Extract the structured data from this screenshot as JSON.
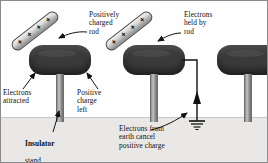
{
  "figure": {
    "background_color": "#fefefe",
    "floor_color": "#e9e8e6",
    "dome_color": "#3a3a3a",
    "rod_color": "#d6d6d6",
    "ink_color": "#0d0d0d"
  },
  "labels": {
    "positively_charged_rod": "Positively\ncharged\nrod",
    "electrons_held_by_rod": "Electrons\nheld by\nrod",
    "electrons_attracted": "Electrons\nattracted",
    "positive_charge_left": "Positive\ncharge\nleft",
    "insulator_bold": "Insulator",
    "insulator_rest": "stand",
    "electrons_from_earth": "Electrons from\nearth cancel\npositive charge"
  },
  "rods": [
    {
      "id": "rod-1",
      "charge_symbol": "+",
      "charge_count": 4,
      "angle_deg": -38
    },
    {
      "id": "rod-2",
      "charge_symbol": "+",
      "charge_count": 4,
      "angle_deg": -38
    }
  ],
  "panels": [
    {
      "id": "panel-1",
      "stage": 1,
      "has_rod": true,
      "has_earth_wire": false,
      "dome_charge": "positive-left-negative-right"
    },
    {
      "id": "panel-2",
      "stage": 2,
      "has_rod": true,
      "has_earth_wire": true,
      "dome_charge": "negative-induced"
    },
    {
      "id": "panel-3",
      "stage": 3,
      "has_rod": false,
      "has_earth_wire": false,
      "dome_charge": "negative"
    }
  ],
  "symbols": {
    "earth_ground": "ground-symbol",
    "current_direction": "upward-arrow"
  }
}
